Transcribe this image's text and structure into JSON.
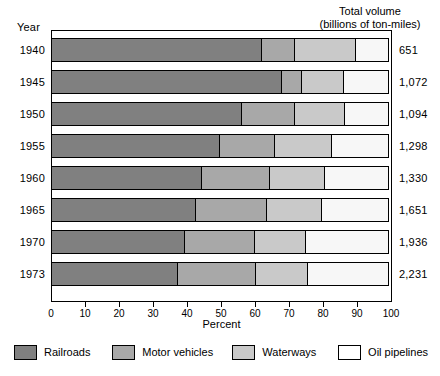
{
  "headers": {
    "year": "Year",
    "total_volume_line1": "Total volume",
    "total_volume_line2": "(billions of ton-miles)"
  },
  "axis": {
    "title": "Percent",
    "ticks": [
      "0",
      "10",
      "20",
      "30",
      "40",
      "50",
      "60",
      "70",
      "80",
      "90",
      "100"
    ]
  },
  "legend": {
    "items": [
      {
        "label": "Railroads",
        "color": "#808080",
        "key": "railroads"
      },
      {
        "label": "Motor vehicles",
        "color": "#a8a8a8",
        "key": "motor"
      },
      {
        "label": "Waterways",
        "color": "#c9c9c9",
        "key": "waterways"
      },
      {
        "label": "Oil pipelines",
        "color": "#ffffff",
        "key": "pipelines"
      }
    ]
  },
  "rows": [
    {
      "year": "1940",
      "total": "651"
    },
    {
      "year": "1945",
      "total": "1,072"
    },
    {
      "year": "1950",
      "total": "1,094"
    },
    {
      "year": "1955",
      "total": "1,298"
    },
    {
      "year": "1960",
      "total": "1,330"
    },
    {
      "year": "1965",
      "total": "1,651"
    },
    {
      "year": "1970",
      "total": "1,936"
    },
    {
      "year": "1973",
      "total": "2,231"
    }
  ],
  "chart_data": {
    "type": "bar",
    "orientation": "horizontal",
    "stacked": true,
    "normalized": true,
    "title": "",
    "xlabel": "Percent",
    "ylabel": "Year",
    "xlim": [
      0,
      100
    ],
    "xticks": [
      0,
      10,
      20,
      30,
      40,
      50,
      60,
      70,
      80,
      90,
      100
    ],
    "grid": false,
    "legend_position": "bottom",
    "categories": [
      "1940",
      "1945",
      "1950",
      "1955",
      "1960",
      "1965",
      "1970",
      "1973"
    ],
    "series": [
      {
        "name": "Railroads",
        "color": "#808080",
        "values": [
          62.0,
          67.7,
          56.0,
          49.5,
          44.3,
          42.5,
          39.3,
          37.2
        ]
      },
      {
        "name": "Motor vehicles",
        "color": "#a8a8a8",
        "values": [
          9.8,
          6.2,
          15.9,
          16.5,
          20.2,
          21.1,
          20.8,
          23.3
        ]
      },
      {
        "name": "Waterways",
        "color": "#c9c9c9",
        "values": [
          18.1,
          12.6,
          14.9,
          17.0,
          16.5,
          16.4,
          15.4,
          15.5
        ]
      },
      {
        "name": "Oil pipelines",
        "color": "#ffffff",
        "values": [
          10.1,
          13.5,
          13.2,
          17.0,
          19.0,
          20.0,
          24.5,
          24.0
        ]
      }
    ],
    "annotations": {
      "right_axis_label": "Total volume (billions of ton-miles)",
      "right_axis_values": [
        "651",
        "1,072",
        "1,094",
        "1,298",
        "1,330",
        "1,651",
        "1,936",
        "2,231"
      ]
    }
  }
}
